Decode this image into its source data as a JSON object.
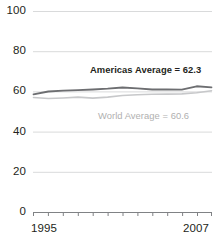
{
  "chart_data": {
    "type": "line",
    "title": "",
    "xlabel": "",
    "ylabel": "",
    "xlim": [
      1995,
      2007
    ],
    "ylim": [
      0,
      100
    ],
    "yticks": [
      0,
      20,
      40,
      60,
      80,
      100
    ],
    "ytick_labels": [
      "0",
      "20",
      "40",
      "60",
      "80",
      "100"
    ],
    "xticks": [
      1995,
      1996,
      1997,
      1998,
      1999,
      2000,
      2001,
      2002,
      2003,
      2004,
      2005,
      2006,
      2007
    ],
    "xtick_labels_shown": [
      "1995",
      "2007"
    ],
    "grid": "horizontal",
    "legend_position": "inline-annotation",
    "x": [
      1995,
      1996,
      1997,
      1998,
      1999,
      2000,
      2001,
      2002,
      2003,
      2004,
      2005,
      2006,
      2007
    ],
    "series": [
      {
        "name": "Americas Average",
        "color": "#6d6e71",
        "values": [
          58.8,
          60.2,
          60.6,
          60.9,
          61.2,
          61.6,
          62.2,
          61.8,
          61.2,
          61.2,
          61.1,
          62.8,
          62.3
        ],
        "annotation": "Americas Average = 62.3",
        "annotation_value": 62.3
      },
      {
        "name": "World Average",
        "color": "#c7c8ca",
        "values": [
          57.2,
          56.7,
          57.0,
          57.4,
          56.9,
          57.4,
          58.2,
          58.6,
          58.8,
          58.9,
          59.0,
          59.6,
          60.6
        ],
        "annotation": "World Average = 60.6",
        "annotation_value": 60.6
      }
    ],
    "annotations": [
      {
        "name": "americas-average-label",
        "text": "Americas Average = 62.3",
        "style": "bold-dark"
      },
      {
        "name": "world-average-label",
        "text": "World Average = 60.6",
        "style": "light-gray"
      }
    ]
  },
  "axis": {
    "y_labels": [
      "100",
      "80",
      "60",
      "40",
      "20",
      "0"
    ],
    "x_labels": [
      "1995",
      "2007"
    ]
  },
  "colors": {
    "background": "#ffffff",
    "gridline": "#d9dadb",
    "axis": "#808285",
    "text": "#231f20",
    "americas_line": "#6d6e71",
    "world_line": "#c7c8ca",
    "world_text": "#b0b0b0"
  }
}
